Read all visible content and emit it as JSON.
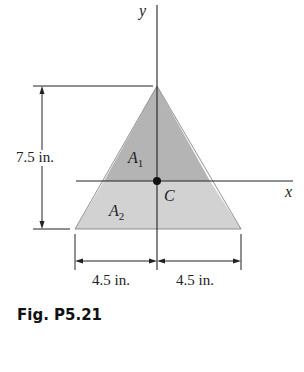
{
  "figure": {
    "caption": "Fig. P5.21",
    "axes": {
      "x_label": "x",
      "y_label": "y"
    },
    "regions": [
      {
        "label": "A",
        "subscript": "1",
        "fill": "#b4b4b4"
      },
      {
        "label": "A",
        "subscript": "2",
        "fill": "#d2d2d2"
      }
    ],
    "centroid_label": "C",
    "dimensions": {
      "height": "7.5 in.",
      "left_half_base": "4.5 in.",
      "right_half_base": "4.5 in."
    }
  }
}
